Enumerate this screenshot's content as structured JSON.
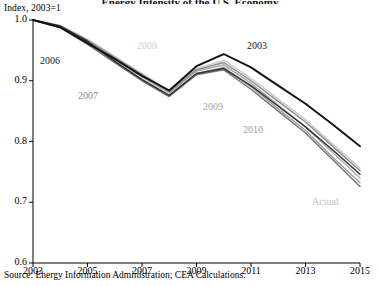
{
  "figure": {
    "title": "Energy Intensity of the U.S. Economy",
    "axis_unit_label": "Index, 2003=1",
    "source": "Source: Energy Information Administration; CEA Calculations."
  },
  "chart_data": {
    "type": "line",
    "title": "Energy Intensity of the U.S. Economy",
    "xlabel": "",
    "ylabel": "Index, 2003=1",
    "xlim": [
      2003,
      2015
    ],
    "ylim": [
      0.6,
      1.0
    ],
    "yticks": [
      "0.6",
      "0.7",
      "0.8",
      "0.9",
      "1.0"
    ],
    "ytick_values": [
      0.6,
      0.7,
      0.8,
      0.9,
      1.0
    ],
    "xticks": [
      "2003",
      "2005",
      "2007",
      "2009",
      "2011",
      "2013",
      "2015"
    ],
    "xtick_values": [
      2003,
      2005,
      2007,
      2009,
      2011,
      2013,
      2015
    ],
    "grid": false,
    "legend": "inline-annotations",
    "x": [
      2003,
      2004,
      2005,
      2006,
      2007,
      2008,
      2009,
      2010,
      2011,
      2012,
      2013,
      2014,
      2015
    ],
    "series": [
      {
        "name": "2003",
        "label": "2003",
        "color": "#111111",
        "width": 1.9,
        "values": [
          1.0,
          0.988,
          0.962,
          0.936,
          0.908,
          0.884,
          0.924,
          0.944,
          0.922,
          0.892,
          0.862,
          0.828,
          0.792
        ]
      },
      {
        "name": "2006",
        "label": "2006",
        "color": "#333333",
        "width": 1.5,
        "values": [
          1.0,
          0.99,
          0.965,
          0.932,
          0.902,
          0.876,
          0.912,
          0.92,
          0.892,
          0.858,
          0.824,
          0.786,
          0.746
        ]
      },
      {
        "name": "2007",
        "label": "2007",
        "color": "#8a8a8a",
        "width": 1.4,
        "values": [
          1.0,
          0.99,
          0.967,
          0.938,
          0.91,
          0.882,
          0.918,
          0.93,
          0.9,
          0.866,
          0.832,
          0.792,
          0.752
        ]
      },
      {
        "name": "2008",
        "label": "2008",
        "color": "#c9c9c9",
        "width": 1.4,
        "values": [
          1.0,
          0.991,
          0.968,
          0.94,
          0.912,
          0.884,
          0.92,
          0.934,
          0.904,
          0.87,
          0.836,
          0.796,
          0.756
        ]
      },
      {
        "name": "2009",
        "label": "2009",
        "color": "#a8a8a8",
        "width": 1.4,
        "values": [
          1.0,
          0.989,
          0.964,
          0.935,
          0.906,
          0.88,
          0.916,
          0.926,
          0.896,
          0.86,
          0.824,
          0.782,
          0.74
        ]
      },
      {
        "name": "2010",
        "label": "2010",
        "color": "#9b9b9b",
        "width": 1.4,
        "values": [
          1.0,
          0.988,
          0.962,
          0.932,
          0.902,
          0.876,
          0.912,
          0.922,
          0.89,
          0.854,
          0.818,
          0.774,
          0.732
        ]
      },
      {
        "name": "Actual",
        "label": "Actual",
        "color": "#777777",
        "width": 1.5,
        "values": [
          1.0,
          0.987,
          0.96,
          0.93,
          0.9,
          0.874,
          0.91,
          0.918,
          0.886,
          0.85,
          0.814,
          0.77,
          0.726
        ]
      }
    ],
    "annotations": [
      {
        "text": "2006",
        "x_px": 40,
        "y_px": 55,
        "color": "#1a1a1a"
      },
      {
        "text": "2007",
        "x_px": 78,
        "y_px": 90,
        "color": "#8a8a8a"
      },
      {
        "text": "2008",
        "x_px": 137,
        "y_px": 40,
        "color": "#d0d0d0"
      },
      {
        "text": "2003",
        "x_px": 247,
        "y_px": 40,
        "color": "#1a1a1a"
      },
      {
        "text": "2009",
        "x_px": 203,
        "y_px": 101,
        "color": "#a8a8a8"
      },
      {
        "text": "2010",
        "x_px": 243,
        "y_px": 124,
        "color": "#9b9b9b"
      },
      {
        "text": "Actual",
        "x_px": 312,
        "y_px": 196,
        "color": "#c2c2c2"
      }
    ]
  }
}
